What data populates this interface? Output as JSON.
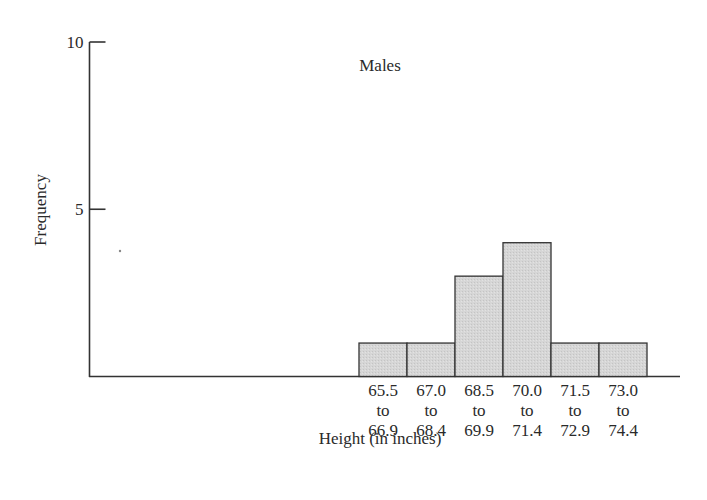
{
  "chart_data": {
    "type": "bar",
    "subtype": "histogram",
    "title": "Males",
    "xlabel": "Height (in inches)",
    "ylabel": "Frequency",
    "categories": [
      [
        "65.5",
        "to",
        "66.9"
      ],
      [
        "67.0",
        "to",
        "68.4"
      ],
      [
        "68.5",
        "to",
        "69.9"
      ],
      [
        "70.0",
        "to",
        "71.4"
      ],
      [
        "71.5",
        "to",
        "72.9"
      ],
      [
        "73.0",
        "to",
        "74.4"
      ]
    ],
    "category_labels": [
      "65.5 to 66.9",
      "67.0 to 68.4",
      "68.5 to 69.9",
      "70.0 to 71.4",
      "71.5 to 72.9",
      "73.0 to 74.4"
    ],
    "values": [
      1,
      1,
      3,
      4,
      1,
      1
    ],
    "ylim": [
      0,
      10
    ],
    "yticks": [
      5,
      10
    ],
    "ytick_labels": [
      "5",
      "10"
    ],
    "grid": false,
    "legend": null,
    "colors": {
      "bar_fill": "#d4d4d4",
      "bar_edge": "#333333",
      "axis": "#333333",
      "text": "#2a2a2a"
    }
  }
}
